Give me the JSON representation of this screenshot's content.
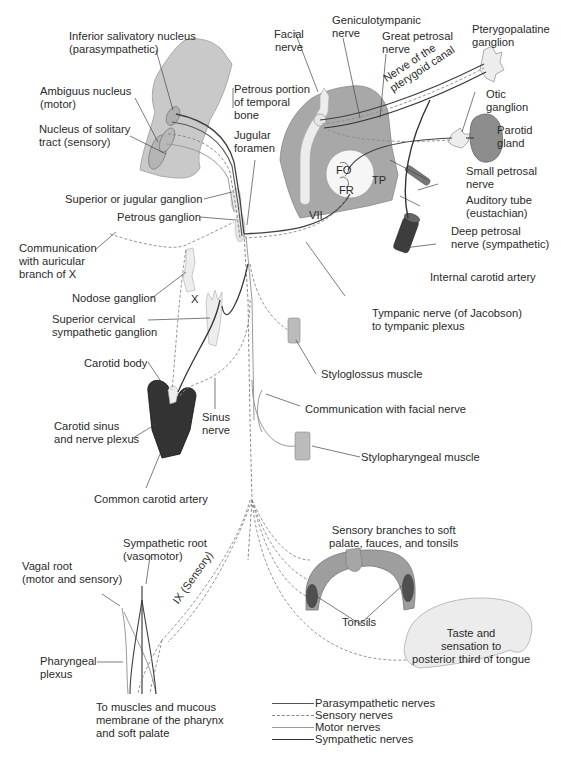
{
  "diagram": {
    "colors": {
      "brainstem": "#c8c8c8",
      "temporal_bone": "#a9a9a9",
      "ganglion": "#ececec",
      "carotid": "#3a3a3a",
      "nerve_dark": "#404040",
      "nerve_sensory": "#8a8a8a",
      "nerve_motor": "#9a9a9a",
      "tongue": "#ededed",
      "palate": "#9c9c9c"
    },
    "labels": {
      "inferior_salivatory": "Inferior salivatory nucleus\n(parasympathetic)",
      "ambiguus": "Ambiguus nucleus\n(motor)",
      "solitary": "Nucleus of solitary\ntract (sensory)",
      "petrous_portion": "Petrous portion\nof temporal\nbone",
      "jugular_foramen": "Jugular\nforamen",
      "facial_nerve": "Facial\nnerve",
      "geniculotympanic": "Geniculotympanic\nnerve",
      "great_petrosal": "Great petrosal\nnerve",
      "pterygoid_canal": "Nerve of the\npterygoid canal",
      "pterygopalatine": "Pterygopalatine\nganglion",
      "otic": "Otic\nganglion",
      "parotid": "Parotid\ngland",
      "small_petrosal": "Small petrosal\nnerve",
      "auditory_tube": "Auditory tube\n(eustachian)",
      "deep_petrosal": "Deep petrosal\nnerve (sympathetic)",
      "internal_carotid": "Internal carotid artery",
      "fo": "FO",
      "fr": "FR",
      "tp": "TP",
      "vii": "VII",
      "superior_jugular": "Superior or jugular ganglion",
      "petrous_ganglion": "Petrous ganglion",
      "communication_auricular": "Communication\nwith auricular\nbranch of X",
      "nodose": "Nodose ganglion",
      "x": "X",
      "superior_cervical": "Superior cervical\nsympathetic ganglion",
      "tympanic_nerve": "Tympanic nerve (of Jacobson)\nto tympanic plexus",
      "styloglossus": "Styloglossus muscle",
      "communication_facial": "Communication with facial nerve",
      "stylopharyngeal": "Stylopharyngeal muscle",
      "carotid_body": "Carotid body",
      "carotid_sinus": "Carotid sinus\nand nerve plexus",
      "sinus_nerve": "Sinus\nnerve",
      "common_carotid": "Common carotid artery",
      "sympathetic_root": "Sympathetic root\n(vasomotor)",
      "vagal_root": "Vagal root\n(motor and sensory)",
      "ix_sensory": "IX (Sensory)",
      "pharyngeal_plexus": "Pharyngeal\nplexus",
      "to_muscles": "To muscles and mucous\nmembrane of the pharynx\nand soft palate",
      "sensory_branches": "Sensory branches to soft\npalate, fauces, and tonsils",
      "tonsils": "Tonsils",
      "taste": "Taste and\nsensation to\nposterior third of tongue"
    },
    "legend": [
      {
        "label": "Parasympathetic nerves",
        "style": "solid",
        "color": "#555555",
        "width": 1.6
      },
      {
        "label": "Sensory nerves",
        "style": "dashed",
        "color": "#8a8a8a",
        "width": 1.1
      },
      {
        "label": "Motor nerves",
        "style": "solid",
        "color": "#9a9a9a",
        "width": 1.1
      },
      {
        "label": "Sympathetic nerves",
        "style": "solid",
        "color": "#333333",
        "width": 1.8
      }
    ]
  }
}
